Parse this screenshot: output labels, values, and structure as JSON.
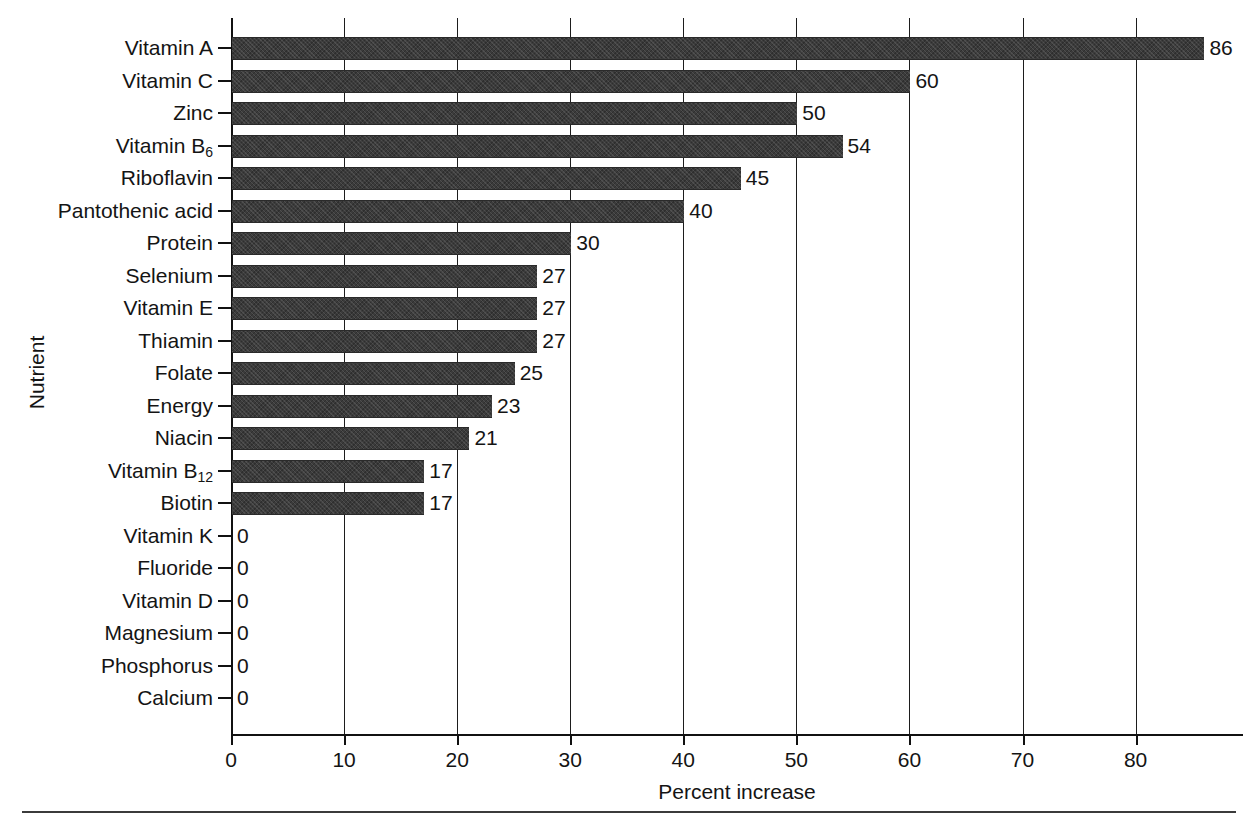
{
  "chart_data": {
    "type": "bar",
    "orientation": "horizontal",
    "title": "",
    "xlabel": "Percent increase",
    "ylabel": "Nutrient",
    "xlim": [
      0,
      89.5
    ],
    "xticks": [
      0,
      10,
      20,
      30,
      40,
      50,
      60,
      70,
      80
    ],
    "grid": "vertical",
    "legend": "none",
    "bar_color": "#3b3b3b",
    "categories": [
      "Vitamin A",
      "Vitamin C",
      "Zinc",
      "Vitamin B6",
      "Riboflavin",
      "Pantothenic acid",
      "Protein",
      "Selenium",
      "Vitamin E",
      "Thiamin",
      "Folate",
      "Energy",
      "Niacin",
      "Vitamin B12",
      "Biotin",
      "Vitamin K",
      "Fluoride",
      "Vitamin D",
      "Magnesium",
      "Phosphorus",
      "Calcium"
    ],
    "values": [
      86,
      60,
      50,
      54,
      45,
      40,
      30,
      27,
      27,
      27,
      25,
      23,
      21,
      17,
      17,
      0,
      0,
      0,
      0,
      0,
      0
    ],
    "data_labels": [
      "86",
      "60",
      "50",
      "54",
      "45",
      "40",
      "30",
      "27",
      "27",
      "27",
      "25",
      "23",
      "21",
      "17",
      "17",
      "0",
      "0",
      "0",
      "0",
      "0",
      "0"
    ],
    "rows": [
      {
        "label": "Vitamin A",
        "sub": "",
        "value": 86,
        "label_text": "86"
      },
      {
        "label": "Vitamin C",
        "sub": "",
        "value": 60,
        "label_text": "60"
      },
      {
        "label": "Zinc",
        "sub": "",
        "value": 50,
        "label_text": "50"
      },
      {
        "label": "Vitamin B",
        "sub": "6",
        "value": 54,
        "label_text": "54"
      },
      {
        "label": "Riboflavin",
        "sub": "",
        "value": 45,
        "label_text": "45"
      },
      {
        "label": "Pantothenic acid",
        "sub": "",
        "value": 40,
        "label_text": "40"
      },
      {
        "label": "Protein",
        "sub": "",
        "value": 30,
        "label_text": "30"
      },
      {
        "label": "Selenium",
        "sub": "",
        "value": 27,
        "label_text": "27"
      },
      {
        "label": "Vitamin E",
        "sub": "",
        "value": 27,
        "label_text": "27"
      },
      {
        "label": "Thiamin",
        "sub": "",
        "value": 27,
        "label_text": "27"
      },
      {
        "label": "Folate",
        "sub": "",
        "value": 25,
        "label_text": "25"
      },
      {
        "label": "Energy",
        "sub": "",
        "value": 23,
        "label_text": "23"
      },
      {
        "label": "Niacin",
        "sub": "",
        "value": 21,
        "label_text": "21"
      },
      {
        "label": "Vitamin B",
        "sub": "12",
        "value": 17,
        "label_text": "17"
      },
      {
        "label": "Biotin",
        "sub": "",
        "value": 17,
        "label_text": "17"
      },
      {
        "label": "Vitamin K",
        "sub": "",
        "value": 0,
        "label_text": "0"
      },
      {
        "label": "Fluoride",
        "sub": "",
        "value": 0,
        "label_text": "0"
      },
      {
        "label": "Vitamin D",
        "sub": "",
        "value": 0,
        "label_text": "0"
      },
      {
        "label": "Magnesium",
        "sub": "",
        "value": 0,
        "label_text": "0"
      },
      {
        "label": "Phosphorus",
        "sub": "",
        "value": 0,
        "label_text": "0"
      },
      {
        "label": "Calcium",
        "sub": "",
        "value": 0,
        "label_text": "0"
      }
    ]
  }
}
